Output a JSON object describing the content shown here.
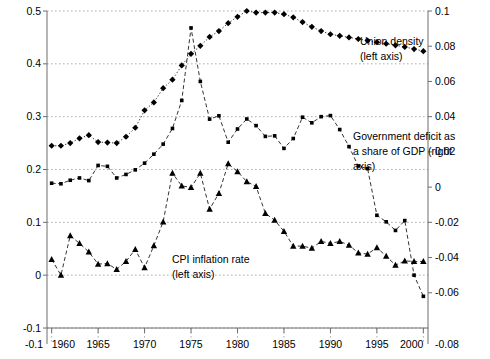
{
  "chart_data": {
    "type": "line",
    "title": "",
    "xlabel": "",
    "ylabel_left": "",
    "ylabel_right": "",
    "xlim": [
      1959.5,
      2000.5
    ],
    "xticks": [
      1960,
      1965,
      1970,
      1975,
      1980,
      1985,
      1990,
      1995,
      2000
    ],
    "xticklabels": [
      "1960",
      "1965",
      "1970",
      "1975",
      "1980",
      "1985",
      "1990",
      "1995",
      "2000"
    ],
    "ylim_left": [
      -0.1,
      0.5
    ],
    "yticks_left": [
      -0.1,
      0,
      0.1,
      0.2,
      0.3,
      0.4,
      0.5
    ],
    "yticklabels_left": [
      "-0.1",
      "0",
      "0.1",
      "0.2",
      "0.3",
      "0.4",
      "0.5"
    ],
    "ylim_right": [
      -0.08,
      0.1
    ],
    "yticks_right": [
      -0.08,
      -0.06,
      -0.04,
      -0.02,
      0,
      0.02,
      0.04,
      0.06,
      0.08,
      0.1
    ],
    "yticklabels_right": [
      "-0.08",
      "-0.06",
      "-0.04",
      "-0.02",
      "0",
      "0.02",
      "0.04",
      "0.06",
      "0.08",
      "0.1"
    ],
    "grid": true,
    "grid_style": "dotted",
    "legend_position": "inline-annotations",
    "x": [
      1960,
      1961,
      1962,
      1963,
      1964,
      1965,
      1966,
      1967,
      1968,
      1969,
      1970,
      1971,
      1972,
      1973,
      1974,
      1975,
      1976,
      1977,
      1978,
      1979,
      1980,
      1981,
      1982,
      1983,
      1984,
      1985,
      1986,
      1987,
      1988,
      1989,
      1990,
      1991,
      1992,
      1993,
      1994,
      1995,
      1996,
      1997,
      1998,
      1999,
      2000
    ],
    "series": [
      {
        "name": "Union density (left axis)",
        "axis": "left",
        "marker": "diamond",
        "color": "#000000",
        "linestyle": "dotted",
        "values": [
          0.245,
          0.245,
          0.25,
          0.259,
          0.265,
          0.252,
          0.251,
          0.25,
          0.262,
          0.279,
          0.312,
          0.327,
          0.354,
          0.37,
          0.397,
          0.419,
          0.434,
          0.451,
          0.462,
          0.477,
          0.489,
          0.5,
          0.497,
          0.497,
          0.497,
          0.494,
          0.488,
          0.479,
          0.47,
          0.462,
          0.456,
          0.453,
          0.45,
          0.447,
          0.444,
          0.441,
          0.438,
          0.435,
          0.432,
          0.428,
          0.424
        ]
      },
      {
        "name": "Government deficit as a share of GDP (right axis)",
        "axis": "right",
        "marker": "square",
        "color": "#000000",
        "linestyle": "dashed",
        "values": [
          0.0022,
          0.0019,
          0.0039,
          0.0052,
          0.0037,
          0.0123,
          0.0118,
          0.0052,
          0.0072,
          0.0098,
          0.0136,
          0.0187,
          0.0244,
          0.0333,
          0.0492,
          0.0904,
          0.06,
          0.0386,
          0.0405,
          0.0255,
          0.033,
          0.0387,
          0.0349,
          0.0288,
          0.0291,
          0.022,
          0.0276,
          0.0397,
          0.0365,
          0.04,
          0.0406,
          0.0327,
          0.023,
          0.012,
          0.0105,
          -0.016,
          -0.0197,
          -0.0246,
          -0.019,
          -0.05,
          -0.062
        ]
      },
      {
        "name": "CPI inflation rate (left axis)",
        "axis": "left",
        "marker": "triangle",
        "color": "#000000",
        "linestyle": "dashed",
        "values": [
          0.03,
          0.0,
          0.075,
          0.06,
          0.044,
          0.021,
          0.022,
          0.011,
          0.026,
          0.049,
          0.014,
          0.056,
          0.101,
          0.193,
          0.169,
          0.166,
          0.193,
          0.125,
          0.155,
          0.211,
          0.196,
          0.177,
          0.168,
          0.117,
          0.104,
          0.083,
          0.055,
          0.055,
          0.051,
          0.064,
          0.06,
          0.064,
          0.057,
          0.042,
          0.04,
          0.052,
          0.036,
          0.019,
          0.027,
          0.026,
          0.026
        ]
      }
    ],
    "annotations": [
      {
        "id": "union-density",
        "text_lines": [
          "Union density",
          "(left axis)"
        ],
        "x_px": 360,
        "y_px": 45
      },
      {
        "id": "government-deficit",
        "text_lines": [
          "Government deficit as",
          "a share of GDP (right",
          "axis)"
        ],
        "x_px": 353,
        "y_px": 140
      },
      {
        "id": "cpi-inflation",
        "text_lines": [
          "CPI inflation rate",
          "(left axis)"
        ],
        "x_px": 172,
        "y_px": 263
      }
    ]
  },
  "plot": {
    "left_px": 47,
    "right_px": 428,
    "top_px": 11,
    "bottom_px": 328
  },
  "colors": {
    "ink": "#000000",
    "grid": "#9a9a9a",
    "axis": "#6e6e6e",
    "background": "#ffffff"
  }
}
